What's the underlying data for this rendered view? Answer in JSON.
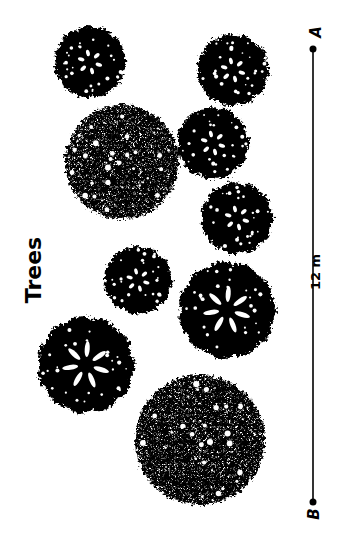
{
  "title": "Trees",
  "scale": {
    "label": "12 m",
    "start_label": "A",
    "end_label": "B",
    "color": "#000000"
  },
  "trees": [
    {
      "id": "tree-1",
      "style": "open-branched",
      "cx": 90,
      "cy": 62,
      "r": 37
    },
    {
      "id": "tree-2",
      "style": "open-branched",
      "cx": 233,
      "cy": 70,
      "r": 37
    },
    {
      "id": "tree-3",
      "style": "dense-foliage",
      "cx": 122,
      "cy": 162,
      "r": 57
    },
    {
      "id": "tree-4",
      "style": "open-branched",
      "cx": 213,
      "cy": 143,
      "r": 37
    },
    {
      "id": "tree-5",
      "style": "open-branched",
      "cx": 237,
      "cy": 218,
      "r": 37
    },
    {
      "id": "tree-6",
      "style": "open-branched",
      "cx": 138,
      "cy": 280,
      "r": 35
    },
    {
      "id": "tree-7",
      "style": "trunk-branched",
      "cx": 227,
      "cy": 310,
      "r": 50
    },
    {
      "id": "tree-8",
      "style": "trunk-branched",
      "cx": 86,
      "cy": 365,
      "r": 50
    },
    {
      "id": "tree-9",
      "style": "dense-foliage",
      "cx": 200,
      "cy": 440,
      "r": 65
    }
  ]
}
